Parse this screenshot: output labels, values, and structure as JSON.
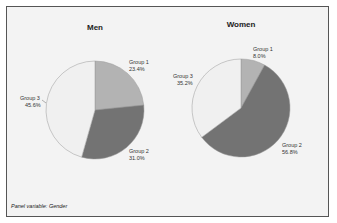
{
  "panel_note": "Panel variable: Gender",
  "colors": {
    "group1": "#b3b3b3",
    "group2": "#737373",
    "group3": "#f0f0f0",
    "background": "#f3f3f3"
  },
  "chart_data": [
    {
      "type": "pie",
      "title": "Men",
      "categories": [
        "Group 1",
        "Group 2",
        "Group 3"
      ],
      "values": [
        23.4,
        31.0,
        45.6
      ],
      "labels": [
        "23.4%",
        "31.0%",
        "45.6%"
      ]
    },
    {
      "type": "pie",
      "title": "Women",
      "categories": [
        "Group 1",
        "Group 2",
        "Group 3"
      ],
      "values": [
        8.0,
        56.8,
        35.2
      ],
      "labels": [
        "8.0%",
        "56.8%",
        "35.2%"
      ]
    }
  ]
}
